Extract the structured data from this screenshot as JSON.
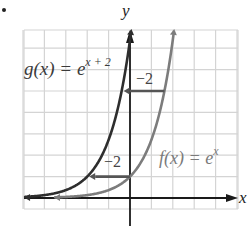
{
  "bullet": "•",
  "labels": {
    "g_prefix": "g(x) = e",
    "g_exp": "x + 2",
    "f_prefix": "f(x) = e",
    "f_exp": "x",
    "x_axis": "x",
    "y_axis": "y",
    "shift_top": "−2",
    "shift_bottom": "−2"
  },
  "colors": {
    "grid": "#d4d4d4",
    "axis": "#1a1a1a",
    "g_curve": "#2e2e2e",
    "f_curve": "#7c7c7c",
    "shift_arrow": "#555555"
  },
  "chart_data": {
    "type": "line",
    "title": "",
    "xlabel": "x",
    "ylabel": "y",
    "xlim": [
      -5,
      5
    ],
    "ylim": [
      -0.5,
      8
    ],
    "grid": true,
    "grid_step": 1,
    "legend": "inline labels",
    "series": [
      {
        "name": "g(x) = e^(x+2)",
        "formula": "e^(x+2)",
        "x": [
          -5,
          -4,
          -3,
          -2,
          -1,
          -0.5,
          0,
          0.08
        ],
        "values": [
          0.05,
          0.14,
          0.37,
          1.0,
          2.72,
          4.48,
          7.39,
          8.0
        ]
      },
      {
        "name": "f(x) = e^x",
        "formula": "e^x",
        "x": [
          -5,
          -4,
          -3,
          -2,
          -1,
          0,
          1,
          1.5,
          2,
          2.08
        ],
        "values": [
          0.01,
          0.02,
          0.05,
          0.14,
          0.37,
          1.0,
          2.72,
          4.48,
          7.39,
          8.0
        ]
      }
    ],
    "annotations": [
      {
        "type": "arrow",
        "label": "−2",
        "from": [
          1.61,
          5
        ],
        "to": [
          -0.39,
          5
        ],
        "meaning": "horizontal shift left by 2"
      },
      {
        "type": "arrow",
        "label": "−2",
        "from": [
          0,
          1
        ],
        "to": [
          -2,
          1
        ],
        "meaning": "horizontal shift left by 2"
      }
    ]
  }
}
